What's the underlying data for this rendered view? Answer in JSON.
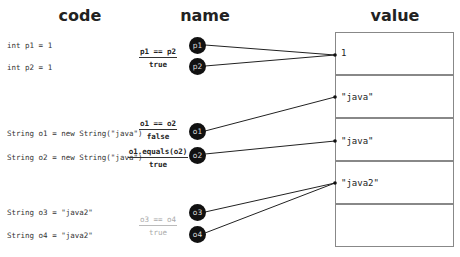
{
  "headings": {
    "code": "code",
    "name": "name",
    "value": "value"
  },
  "code_lines": [
    "int p1 = 1",
    "int p2 = 1",
    "String o1 = new String(\"java\")",
    "String o2 = new String(\"java\")",
    "String o3 = \"java2\"",
    "String o4 = \"java2\""
  ],
  "comparisons": [
    {
      "expr": "p1 == p2",
      "result": "true"
    },
    {
      "expr": "o1 == o2",
      "result": "false"
    },
    {
      "expr": "o1.equals(o2)",
      "result": "true"
    },
    {
      "expr": "o3 == o4",
      "result": "true"
    }
  ],
  "nodes": [
    "p1",
    "p2",
    "o1",
    "o2",
    "o3",
    "o4"
  ],
  "values": [
    "1",
    "\"java\"",
    "\"java\"",
    "\"java2\"",
    ""
  ]
}
